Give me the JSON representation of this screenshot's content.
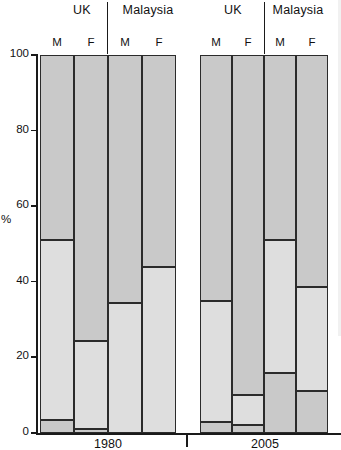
{
  "chart_data": {
    "type": "bar",
    "subtype": "stacked-percentage",
    "title": "",
    "xlabel": "",
    "ylabel": "%",
    "ylim": [
      0,
      100
    ],
    "yticks": [
      0,
      20,
      40,
      60,
      80,
      100
    ],
    "ytick_labels": [
      "0",
      "20",
      "40",
      "60",
      "80",
      "100"
    ],
    "grid": false,
    "legend": "none",
    "groups": [
      "1980",
      "2005"
    ],
    "countries": [
      "UK",
      "Malaysia"
    ],
    "sexes": [
      "M",
      "F"
    ],
    "stack_order_bottom_to_top": [
      "segment_low",
      "segment_mid",
      "segment_high"
    ],
    "categories": [
      "1980 UK M",
      "1980 UK F",
      "1980 Malaysia M",
      "1980 Malaysia F",
      "2005 UK M",
      "2005 UK F",
      "2005 Malaysia M",
      "2005 Malaysia F"
    ],
    "series": [
      {
        "name": "segment_low",
        "values": [
          3.5,
          1.0,
          0.0,
          0.0,
          3.0,
          2.0,
          16.0,
          11.0
        ]
      },
      {
        "name": "segment_mid",
        "values": [
          47.5,
          23.3,
          34.5,
          44.0,
          32.0,
          8.0,
          35.0,
          27.5
        ]
      },
      {
        "name": "segment_high",
        "values": [
          49.0,
          75.7,
          65.5,
          56.0,
          65.0,
          90.0,
          49.0,
          61.5
        ]
      }
    ],
    "boundaries_percent": {
      "1980 UK M": [
        3.5,
        51.0
      ],
      "1980 UK F": [
        1.0,
        24.3
      ],
      "1980 Malaysia M": [
        34.5,
        60.0
      ],
      "1980 Malaysia F": [
        44.0,
        64.5
      ],
      "2005 UK M": [
        3.0,
        35.0
      ],
      "2005 UK F": [
        2.0,
        10.0
      ],
      "2005 Malaysia M": [
        16.0,
        51.0
      ],
      "2005 Malaysia F": [
        11.0,
        38.5
      ]
    }
  },
  "axis": {
    "y_title": "%",
    "y_tick_labels": [
      "100",
      "80",
      "60",
      "40",
      "20",
      "0"
    ]
  },
  "headers": {
    "g1_country1": "UK",
    "g1_country2": "Malaysia",
    "g2_country1": "UK",
    "g2_country2": "Malaysia"
  },
  "sex_labels": {
    "g1_uk_m": "M",
    "g1_uk_f": "F",
    "g1_my_m": "M",
    "g1_my_f": "F",
    "g2_uk_m": "M",
    "g2_uk_f": "F",
    "g2_my_m": "M",
    "g2_my_f": "F"
  },
  "year_labels": {
    "left": "1980",
    "right": "2005"
  },
  "colors": {
    "segment_high": "#c9c9c9",
    "segment_mid": "#dedede",
    "segment_low": "#c9c9c9",
    "outline": "#2b2b2b",
    "axis": "#1a1a1a",
    "background": "#ffffff"
  }
}
